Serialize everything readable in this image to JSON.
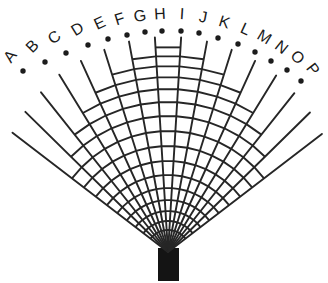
{
  "figure": {
    "type": "fan-diagram",
    "background_color": "#ffffff",
    "line_color": "#262626",
    "label_color": "#1a1a1a",
    "dot_color": "#1c1c1c",
    "stem_color": "#141414",
    "canvas": {
      "width": 328,
      "height": 283
    },
    "apex": {
      "x": 168,
      "y": 252
    },
    "ray_count": 16,
    "arc_ring_count": 16,
    "labels": [
      "A",
      "B",
      "C",
      "D",
      "E",
      "F",
      "G",
      "H",
      "I",
      "J",
      "K",
      "L",
      "M",
      "N",
      "O",
      "P"
    ],
    "rays": [
      {
        "label": "A",
        "angle_deg": -52.5,
        "length": 196,
        "dot": {
          "x": 23,
          "y": 71
        },
        "label_pos": {
          "x": 11,
          "y": 57
        },
        "label_rotation": -52.5,
        "first_rung_index": 9
      },
      {
        "label": "B",
        "angle_deg": -45.5,
        "length": 200,
        "dot": {
          "x": 45,
          "y": 62
        },
        "label_pos": {
          "x": 33,
          "y": 47
        },
        "label_rotation": -45.5,
        "first_rung_index": 8
      },
      {
        "label": "C",
        "angle_deg": -38.5,
        "length": 204,
        "dot": {
          "x": 66,
          "y": 53
        },
        "label_pos": {
          "x": 55,
          "y": 38
        },
        "label_rotation": -38.5,
        "first_rung_index": 7
      },
      {
        "label": "D",
        "angle_deg": -31.5,
        "length": 208,
        "dot": {
          "x": 88,
          "y": 45
        },
        "label_pos": {
          "x": 78,
          "y": 30
        },
        "label_rotation": -31.5,
        "first_rung_index": 6
      },
      {
        "label": "E",
        "angle_deg": -24.5,
        "length": 210,
        "dot": {
          "x": 108,
          "y": 39
        },
        "label_pos": {
          "x": 100,
          "y": 24
        },
        "label_rotation": -24.5,
        "first_rung_index": 5
      },
      {
        "label": "F",
        "angle_deg": -17.5,
        "length": 212,
        "dot": {
          "x": 127,
          "y": 35
        },
        "label_pos": {
          "x": 120,
          "y": 20
        },
        "label_rotation": -17.5,
        "first_rung_index": 4
      },
      {
        "label": "G",
        "angle_deg": -10.5,
        "length": 214,
        "dot": {
          "x": 145,
          "y": 32
        },
        "label_pos": {
          "x": 140,
          "y": 17
        },
        "label_rotation": -10.5,
        "first_rung_index": 3
      },
      {
        "label": "H",
        "angle_deg": -3.5,
        "length": 215,
        "dot": {
          "x": 162,
          "y": 31
        },
        "label_pos": {
          "x": 160,
          "y": 15
        },
        "label_rotation": -3.5,
        "first_rung_index": 1
      },
      {
        "label": "I",
        "angle_deg": 3.5,
        "length": 215,
        "dot": {
          "x": 181,
          "y": 31
        },
        "label_pos": {
          "x": 182,
          "y": 15
        },
        "label_rotation": 3.5,
        "first_rung_index": 1
      },
      {
        "label": "J",
        "angle_deg": 10.5,
        "length": 214,
        "dot": {
          "x": 199,
          "y": 33
        },
        "label_pos": {
          "x": 203,
          "y": 18
        },
        "label_rotation": 10.5,
        "first_rung_index": 3
      },
      {
        "label": "K",
        "angle_deg": 17.5,
        "length": 212,
        "dot": {
          "x": 218,
          "y": 38
        },
        "label_pos": {
          "x": 224,
          "y": 23
        },
        "label_rotation": 17.5,
        "first_rung_index": 4
      },
      {
        "label": "L",
        "angle_deg": 24.5,
        "length": 210,
        "dot": {
          "x": 238,
          "y": 44
        },
        "label_pos": {
          "x": 245,
          "y": 30
        },
        "label_rotation": 24.5,
        "first_rung_index": 5
      },
      {
        "label": "M",
        "angle_deg": 31.5,
        "length": 207,
        "dot": {
          "x": 255,
          "y": 52
        },
        "label_pos": {
          "x": 264,
          "y": 38
        },
        "label_rotation": 31.5,
        "first_rung_index": 6
      },
      {
        "label": "N",
        "angle_deg": 38.5,
        "length": 203,
        "dot": {
          "x": 271,
          "y": 61
        },
        "label_pos": {
          "x": 281,
          "y": 48
        },
        "label_rotation": 38.5,
        "first_rung_index": 7
      },
      {
        "label": "O",
        "angle_deg": 45.5,
        "length": 199,
        "dot": {
          "x": 287,
          "y": 70
        },
        "label_pos": {
          "x": 297,
          "y": 58
        },
        "label_rotation": 45.5,
        "first_rung_index": 8
      },
      {
        "label": "P",
        "angle_deg": 52.5,
        "length": 194,
        "dot": {
          "x": 301,
          "y": 81
        },
        "label_pos": {
          "x": 312,
          "y": 70
        },
        "label_rotation": 52.5,
        "first_rung_index": 9
      }
    ],
    "arc_rings": [
      {
        "index": 0,
        "radius": 22,
        "from_ray": 0,
        "to_ray": 15
      },
      {
        "index": 1,
        "radius": 31,
        "from_ray": 0,
        "to_ray": 15
      },
      {
        "index": 2,
        "radius": 41,
        "from_ray": 0,
        "to_ray": 15
      },
      {
        "index": 3,
        "radius": 52,
        "from_ray": 0,
        "to_ray": 15
      },
      {
        "index": 4,
        "radius": 64,
        "from_ray": 0,
        "to_ray": 15
      },
      {
        "index": 5,
        "radius": 77,
        "from_ray": 0,
        "to_ray": 15
      },
      {
        "index": 6,
        "radius": 91,
        "from_ray": 0,
        "to_ray": 15
      },
      {
        "index": 7,
        "radius": 106,
        "from_ray": 0,
        "to_ray": 15
      },
      {
        "index": 8,
        "radius": 121,
        "from_ray": 0,
        "to_ray": 15
      },
      {
        "index": 9,
        "radius": 136,
        "from_ray": 1,
        "to_ray": 14
      },
      {
        "index": 10,
        "radius": 150,
        "from_ray": 2,
        "to_ray": 13
      },
      {
        "index": 11,
        "radius": 163,
        "from_ray": 3,
        "to_ray": 12
      },
      {
        "index": 12,
        "radius": 175,
        "from_ray": 4,
        "to_ray": 11
      },
      {
        "index": 13,
        "radius": 186,
        "from_ray": 5,
        "to_ray": 10
      },
      {
        "index": 14,
        "radius": 196,
        "from_ray": 6,
        "to_ray": 9
      },
      {
        "index": 15,
        "radius": 205,
        "from_ray": 7,
        "to_ray": 8
      }
    ],
    "stem": {
      "x": 158,
      "y": 248,
      "width": 21,
      "height": 33
    }
  }
}
